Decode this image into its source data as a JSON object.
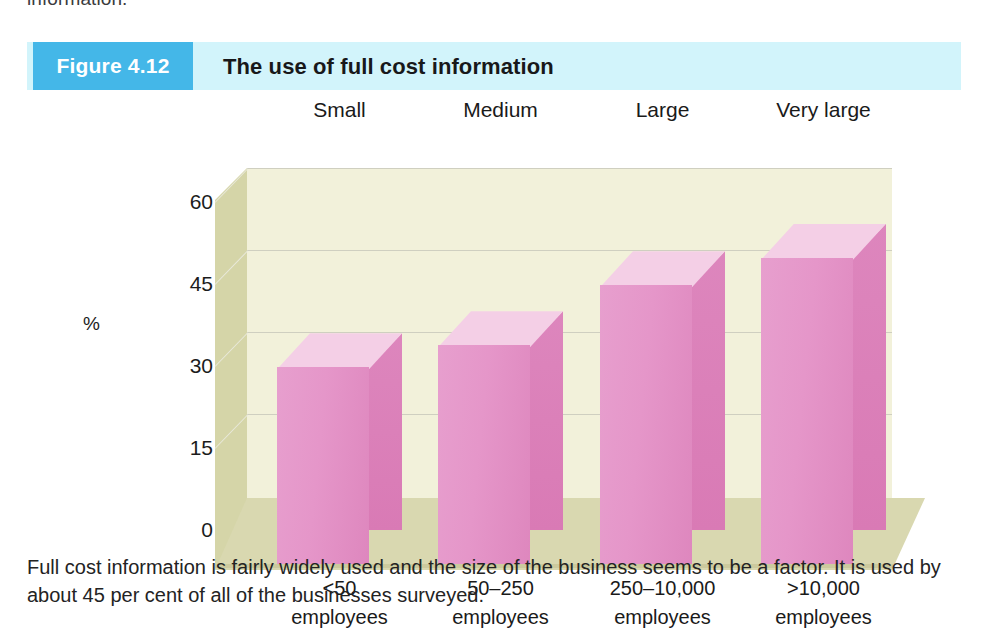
{
  "page": {
    "running_text_above": "information."
  },
  "figure": {
    "number_label": "Figure 4.12",
    "title": "The use of full cost information",
    "caption": "Full cost information is fairly widely used and the size of the business seems to be a factor. It is used by about 45 per cent of all of the businesses surveyed.",
    "accent_color": "#44b7e8",
    "header_band_color": "#d2f4fb",
    "bar_color": "#e293c7",
    "plot_background_color": "#f2f1da"
  },
  "chart_data": {
    "type": "bar",
    "title": "The use of full cost information",
    "xlabel": "",
    "ylabel": "%",
    "ylim": [
      0,
      60
    ],
    "yticks": [
      0,
      15,
      30,
      45,
      60
    ],
    "grid": true,
    "legend": "none",
    "style": "3d-column",
    "categories": [
      "<50\nemployees",
      "50–250\nemployees",
      "250–10,000\nemployees",
      ">10,000\nemployees"
    ],
    "category_labels": [
      {
        "size": "Small",
        "range_line1": "<50",
        "range_line2": "employees"
      },
      {
        "size": "Medium",
        "range_line1": "50–250",
        "range_line2": "employees"
      },
      {
        "size": "Large",
        "range_line1": "250–10,000",
        "range_line2": "employees"
      },
      {
        "size": "Very large",
        "range_line1": ">10,000",
        "range_line2": "employees"
      }
    ],
    "values": [
      36,
      40,
      51,
      56
    ]
  }
}
